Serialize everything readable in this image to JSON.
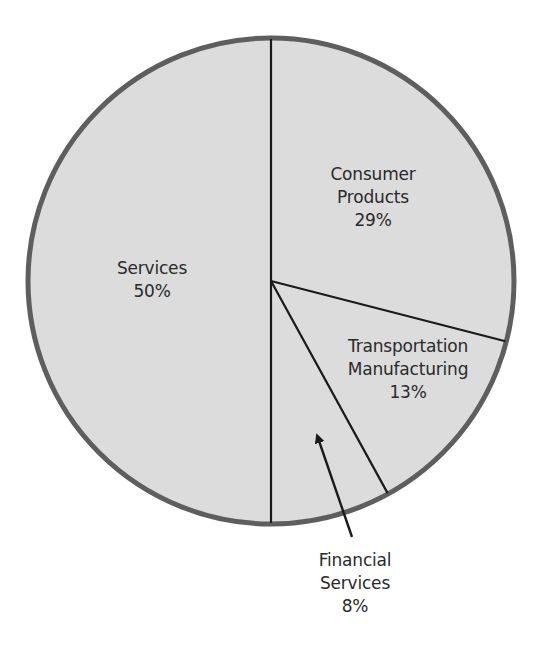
{
  "chart_data": {
    "type": "pie",
    "title": "",
    "start_angle_deg": -90,
    "direction": "clockwise",
    "center": [
      271,
      281
    ],
    "radius": 243,
    "fill_color": "#dcdcdc",
    "border_color": "#5e5e5e",
    "line_color": "#1a1a1a",
    "slices": [
      {
        "name": "Consumer Products",
        "label_lines": [
          "Consumer",
          "Products"
        ],
        "value": 29,
        "value_label": "29%"
      },
      {
        "name": "Transportation Manufacturing",
        "label_lines": [
          "Transportation",
          "Manufacturing"
        ],
        "value": 13,
        "value_label": "13%"
      },
      {
        "name": "Financial Services",
        "label_lines": [
          "Financial",
          "Services"
        ],
        "value": 8,
        "value_label": "8%",
        "label_outside": true,
        "arrow": true
      },
      {
        "name": "Services",
        "label_lines": [
          "Services"
        ],
        "value": 50,
        "value_label": "50%"
      }
    ],
    "legend": null
  },
  "labels": {
    "consumer": {
      "l1": "Consumer",
      "l2": "Products",
      "pct": "29%"
    },
    "transport": {
      "l1": "Transportation",
      "l2": "Manufacturing",
      "pct": "13%"
    },
    "financial": {
      "l1": "Financial",
      "l2": "Services",
      "pct": "8%"
    },
    "services": {
      "l1": "Services",
      "pct": "50%"
    }
  }
}
